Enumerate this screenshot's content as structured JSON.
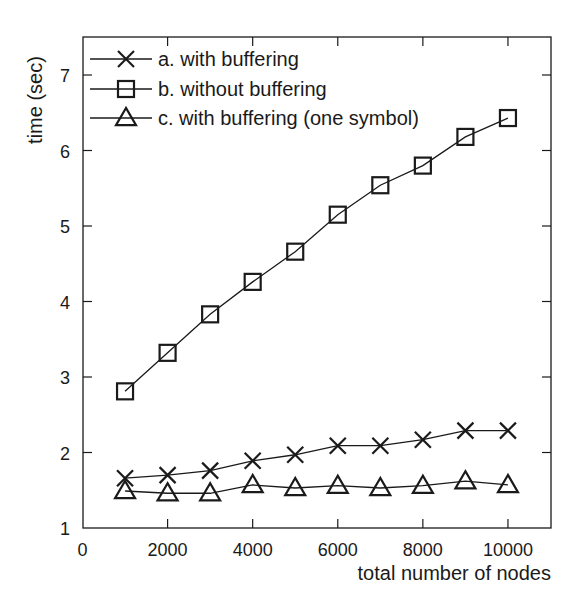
{
  "chart_data": {
    "type": "line",
    "title": "",
    "xlabel": "total number of nodes",
    "ylabel": "time (sec)",
    "xlim": [
      0,
      11000
    ],
    "ylim": [
      1,
      7.5
    ],
    "xticks": [
      0,
      2000,
      4000,
      6000,
      8000,
      10000
    ],
    "yticks": [
      1,
      2,
      3,
      4,
      5,
      6,
      7
    ],
    "grid": false,
    "legend_position": "upper left",
    "x": [
      1000,
      2000,
      3000,
      4000,
      5000,
      6000,
      7000,
      8000,
      9000,
      10000
    ],
    "series": [
      {
        "name": "a. with buffering",
        "marker": "x",
        "values": [
          1.66,
          1.7,
          1.76,
          1.89,
          1.97,
          2.09,
          2.09,
          2.17,
          2.29,
          2.29
        ]
      },
      {
        "name": "b. without buffering",
        "marker": "square",
        "values": [
          2.81,
          3.32,
          3.83,
          4.26,
          4.66,
          5.15,
          5.54,
          5.8,
          6.18,
          6.43
        ]
      },
      {
        "name": "c. with buffering (one symbol)",
        "marker": "triangle",
        "values": [
          1.49,
          1.46,
          1.46,
          1.57,
          1.53,
          1.56,
          1.53,
          1.56,
          1.62,
          1.57
        ]
      }
    ]
  },
  "colors": {
    "line": "#1a1a1a",
    "background": "#ffffff"
  }
}
